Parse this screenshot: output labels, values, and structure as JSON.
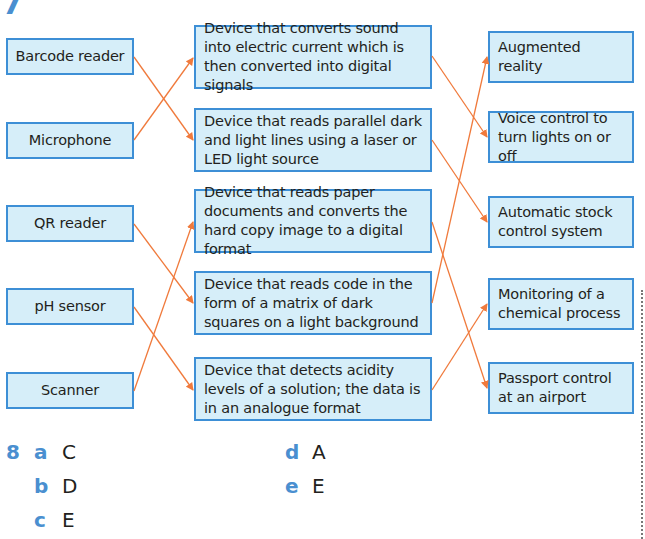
{
  "question7": {
    "number": "7",
    "left_items": [
      {
        "label": "Barcode reader"
      },
      {
        "label": "Microphone"
      },
      {
        "label": "QR reader"
      },
      {
        "label": "pH sensor"
      },
      {
        "label": "Scanner"
      }
    ],
    "middle_items": [
      {
        "label": "Device that converts sound into electric current which is then converted into digital signals"
      },
      {
        "label": "Device that reads parallel dark and light lines using a laser or LED light source"
      },
      {
        "label": "Device that reads paper documents and converts the hard copy image to a digital format"
      },
      {
        "label": "Device that reads code in the form of a matrix of dark squares on a light background"
      },
      {
        "label": "Device that detects acidity levels of a solution; the data is in an analogue format"
      }
    ],
    "right_items": [
      {
        "label": "Augmented reality"
      },
      {
        "label": "Voice control to turn lights on or off"
      },
      {
        "label": "Automatic stock control system"
      },
      {
        "label": "Monitoring of a chemical process"
      },
      {
        "label": "Passport control at an airport"
      }
    ],
    "left_to_middle": [
      [
        0,
        1
      ],
      [
        1,
        0
      ],
      [
        2,
        3
      ],
      [
        3,
        4
      ],
      [
        4,
        2
      ]
    ],
    "middle_to_right": [
      [
        0,
        1
      ],
      [
        1,
        2
      ],
      [
        2,
        4
      ],
      [
        3,
        0
      ],
      [
        4,
        3
      ]
    ]
  },
  "question8": {
    "number": "8",
    "answers": [
      {
        "letter": "a",
        "value": "C"
      },
      {
        "letter": "b",
        "value": "D"
      },
      {
        "letter": "c",
        "value": "E"
      },
      {
        "letter": "d",
        "value": "A"
      },
      {
        "letter": "e",
        "value": "E"
      }
    ]
  },
  "colors": {
    "box_fill": "#d6eef9",
    "box_border": "#3d8fd6",
    "arrow": "#f07a3c",
    "accent_blue": "#4a8fd0",
    "text": "#231f20"
  }
}
